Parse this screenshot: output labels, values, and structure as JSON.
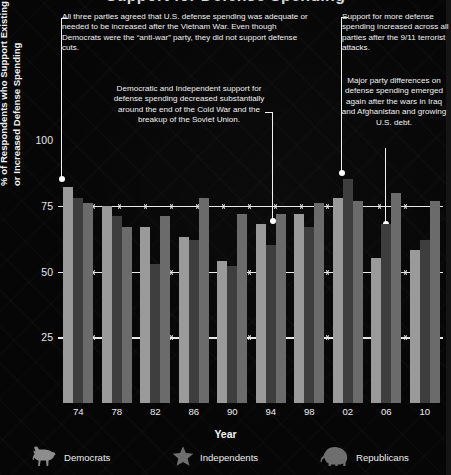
{
  "chart_data": {
    "type": "bar",
    "title": "Support for Defense Spending",
    "xlabel": "Year",
    "ylabel": "% of Respondents who Support Existing\nor Increased Defense Spending",
    "categories": [
      "74",
      "78",
      "82",
      "86",
      "90",
      "94",
      "98",
      "02",
      "06",
      "10"
    ],
    "yticks": [
      "100",
      "75",
      "50",
      "25"
    ],
    "ytick_values": [
      100,
      75,
      50,
      25
    ],
    "ylim": [
      0,
      100
    ],
    "grid": true,
    "legend_position": "bottom",
    "series": [
      {
        "name": "Democrats",
        "color": "#9a9a9a",
        "icon": "donkey-icon",
        "values": [
          82,
          75,
          67,
          63,
          54,
          68,
          72,
          78,
          55,
          58
        ]
      },
      {
        "name": "Independents",
        "color": "#3e3e3e",
        "icon": "star-icon",
        "values": [
          78,
          71,
          53,
          62,
          52,
          60,
          67,
          85,
          68,
          62
        ]
      },
      {
        "name": "Republicans",
        "color": "#6b6b6b",
        "icon": "elephant-icon",
        "values": [
          76,
          67,
          71,
          78,
          72,
          72,
          76,
          77,
          80,
          77
        ]
      }
    ]
  },
  "annotations": [
    {
      "id": "a1",
      "text": "All three parties agreed that U.S. defense spending was adequate or needed to be increased after the Vietnam War. Even though Democrats were the “anti-war” party, they did not support defense cuts."
    },
    {
      "id": "a2",
      "text": "Democratic and Independent support for defense spending decreased substantially around the end of the Cold War and the breakup of the Soviet Union."
    },
    {
      "id": "a3",
      "text": "Support for more defense spending increased across all parties after the 9/11 terrorist attacks."
    },
    {
      "id": "a4",
      "text": "Major party differences on defense spending emerged again after the wars in Iraq and Afghanistan and growing U.S. debt."
    }
  ],
  "legend": {
    "items": [
      {
        "label": "Democrats",
        "icon": "donkey-icon"
      },
      {
        "label": "Independents",
        "icon": "star-icon"
      },
      {
        "label": "Republicans",
        "icon": "elephant-icon"
      }
    ]
  },
  "colors": {
    "background": "#060606",
    "grid": "#e9e9e9",
    "text": "#ededed",
    "democrats": "#9a9a9a",
    "independents": "#3e3e3e",
    "republicans": "#6b6b6b"
  }
}
